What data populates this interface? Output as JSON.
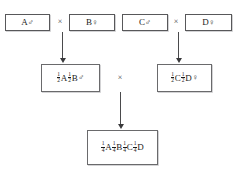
{
  "diagram": {
    "symbols": {
      "cross": "×",
      "male": "♂",
      "female": "♀"
    },
    "parents": [
      {
        "id": "A",
        "allele": "A",
        "sex": "♂",
        "label": "A♂"
      },
      {
        "id": "B",
        "allele": "B",
        "sex": "♀",
        "label": "B♀"
      },
      {
        "id": "C",
        "allele": "C",
        "sex": "♂",
        "label": "C♂"
      },
      {
        "id": "D",
        "allele": "D",
        "sex": "♀",
        "label": "D♀"
      }
    ],
    "crosses": {
      "top_left": "×",
      "top_right": "×",
      "center": "×"
    },
    "f1": [
      {
        "id": "AB",
        "label": "1/2 A 1/2 B ♂",
        "sex": "♂",
        "terms": [
          {
            "num": "1",
            "den": "2",
            "allele": "A"
          },
          {
            "num": "1",
            "den": "2",
            "allele": "B"
          }
        ]
      },
      {
        "id": "CD",
        "label": "1/2 C 1/2 D ♀",
        "sex": "♀",
        "terms": [
          {
            "num": "1",
            "den": "2",
            "allele": "C"
          },
          {
            "num": "1",
            "den": "2",
            "allele": "D"
          }
        ]
      }
    ],
    "f2": {
      "id": "ABCD",
      "label": "1/4 A 1/4 B 1/4 C 1/4 D",
      "sex": "",
      "terms": [
        {
          "num": "1",
          "den": "4",
          "allele": "A"
        },
        {
          "num": "1",
          "den": "4",
          "allele": "B"
        },
        {
          "num": "1",
          "den": "4",
          "allele": "C"
        },
        {
          "num": "1",
          "den": "4",
          "allele": "D"
        }
      ]
    },
    "arrows": [
      {
        "id": "left",
        "from": "A × B",
        "to": "1/2 A 1/2 B ♂"
      },
      {
        "id": "right",
        "from": "C × D",
        "to": "1/2 C 1/2 D ♀"
      },
      {
        "id": "bottom",
        "from": "F1 × F1",
        "to": "1/4 A 1/4 B 1/4 C 1/4 D"
      }
    ],
    "colors": {
      "border": "#58585a",
      "shadow": "#c9c9cb",
      "text": "#1a1a1a",
      "arrow": "#3a3a3c",
      "background": "#ffffff"
    }
  }
}
